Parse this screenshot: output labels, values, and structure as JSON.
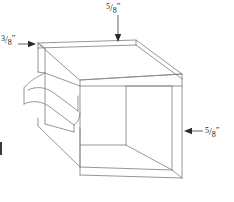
{
  "drawing": {
    "title": "Isometric open box with bullnose molding",
    "background_color": "#ffffff",
    "line_color": "#8a8a8a",
    "line_color_dark": "#6f6f6f",
    "leader_color": "#3a3a3a",
    "text_color": "#1a1a1a"
  },
  "annotations": {
    "top": {
      "numerator": "5",
      "slash": "/",
      "denominator": "8",
      "unit": "”",
      "full_text": "5/8”",
      "arrow_direction": "down",
      "points_at": "top-face-thickness"
    },
    "left": {
      "numerator": "3",
      "slash": "/",
      "denominator": "8",
      "unit": "”",
      "full_text": "3/8”",
      "arrow_direction": "right",
      "points_at": "left-edge-thickness"
    },
    "right": {
      "numerator": "5",
      "slash": "/",
      "denominator": "8",
      "unit": "”",
      "full_text": "5/8”",
      "arrow_direction": "left",
      "points_at": "right-side-panel-thickness"
    }
  }
}
